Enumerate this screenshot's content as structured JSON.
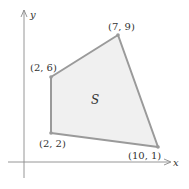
{
  "diagram": {
    "region_label": "S",
    "axes": {
      "x_label": "x",
      "y_label": "y"
    },
    "vertices": [
      {
        "label": "(2, 6)",
        "x": 2,
        "y": 6
      },
      {
        "label": "(7, 9)",
        "x": 7,
        "y": 9
      },
      {
        "label": "(10, 1)",
        "x": 10,
        "y": 1
      },
      {
        "label": "(2, 2)",
        "x": 2,
        "y": 2
      }
    ],
    "colors": {
      "fill": "#f0f0f0",
      "edge": "#9a9a9a",
      "axis": "#8a8a8a",
      "text": "#333333"
    }
  }
}
